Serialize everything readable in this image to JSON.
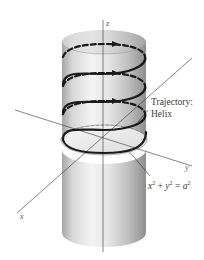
{
  "figure": {
    "type": "helix-on-cylinder",
    "axes": {
      "z": {
        "label": "z"
      },
      "y": {
        "label": "y"
      },
      "x": {
        "label": "x"
      }
    },
    "annotations": {
      "trajectory_line1": "Trajectory:",
      "trajectory_line2": "Helix",
      "equation": {
        "x": "x",
        "x_exp": "2",
        "plus": " + ",
        "y": "y",
        "y_exp": "2",
        "equals": " = ",
        "a": "a",
        "a_exp": "2"
      }
    },
    "colors": {
      "helix": "#1a1a1a",
      "axis": "#333333",
      "cylinder_light": "#f2f2f2",
      "cylinder_dark": "#9a9a9a"
    },
    "helix_turns": 3
  }
}
